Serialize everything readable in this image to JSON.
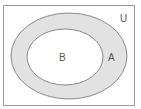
{
  "diagram": {
    "type": "venn",
    "universe": {
      "label": "U"
    },
    "sets": [
      {
        "id": "A",
        "label": "A",
        "fill": "#e2e2e2",
        "stroke": "#8a8a8a"
      },
      {
        "id": "B",
        "label": "B",
        "fill": "#ffffff",
        "stroke": "#8a8a8a",
        "subset_of": "A"
      }
    ],
    "colors": {
      "frame": "#9a9a9a",
      "background": "#ffffff",
      "text": "#555555"
    }
  }
}
